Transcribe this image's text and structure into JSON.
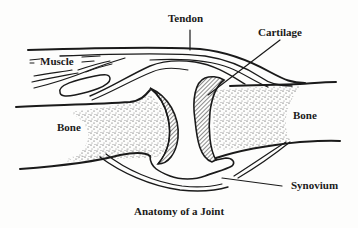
{
  "diagram": {
    "title": "Anatomy of a Joint",
    "labels": {
      "tendon": "Tendon",
      "cartilage": "Cartilage",
      "muscle": "Muscle",
      "bone_left": "Bone",
      "bone_right": "Bone",
      "synovium": "Synovium"
    },
    "colors": {
      "ink": "#1a1a1a",
      "background": "#fdfdfc"
    }
  }
}
